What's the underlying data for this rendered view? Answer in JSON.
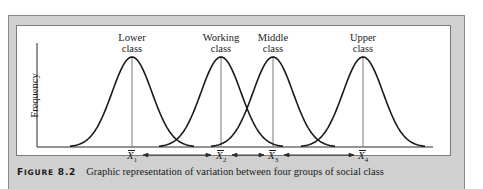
{
  "figure": {
    "number_label_first": "F",
    "number_label_rest": "IGURE",
    "number": "8.2",
    "caption": "Graphic representation of variation between four groups of social class"
  },
  "axes": {
    "ylabel": "Frequency",
    "xlabel": ""
  },
  "groups": [
    {
      "label_line1": "Lower",
      "label_line2": "class",
      "mean_symbol": "X",
      "mean_sub": "1"
    },
    {
      "label_line1": "Working",
      "label_line2": "class",
      "mean_symbol": "X",
      "mean_sub": "2"
    },
    {
      "label_line1": "Middle",
      "label_line2": "class",
      "mean_symbol": "X",
      "mean_sub": "3"
    },
    {
      "label_line1": "Upper",
      "label_line2": "class",
      "mean_symbol": "X",
      "mean_sub": "4"
    }
  ],
  "colors": {
    "frame": "#d0d0d0",
    "panel": "#ffffff",
    "curve": "#1a1a1a",
    "mean_line": "#7a7a7a"
  },
  "chart_data": {
    "type": "line",
    "title": "Graphic representation of variation between four groups of social class",
    "xlabel": "",
    "ylabel": "Frequency",
    "x_tick_labels": [
      "X̄1",
      "X̄2",
      "X̄3",
      "X̄4"
    ],
    "series": [
      {
        "name": "Lower class",
        "distribution": "normal",
        "mean_position": 1.0,
        "relative_sd": 1.0
      },
      {
        "name": "Working class",
        "distribution": "normal",
        "mean_position": 2.0,
        "relative_sd": 1.0
      },
      {
        "name": "Middle class",
        "distribution": "normal",
        "mean_position": 2.6,
        "relative_sd": 1.0
      },
      {
        "name": "Upper class",
        "distribution": "normal",
        "mean_position": 3.6,
        "relative_sd": 1.0
      }
    ],
    "annotations": [
      "double arrow between X̄1 and X̄2",
      "double arrow between X̄2 and X̄3",
      "double arrow between X̄3 and X̄4",
      "vertical lines at each mean"
    ],
    "grid": false,
    "legend": "none (labels above peaks)"
  }
}
